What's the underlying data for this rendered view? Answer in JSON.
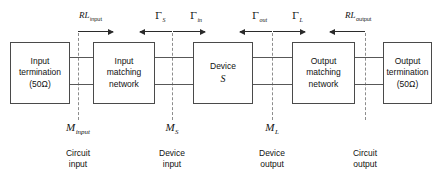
{
  "diagram": {
    "width": 438,
    "height": 185,
    "line_color": "#585858",
    "box_border_color": "#4a4a4a",
    "dash_color": "#8d8d8d",
    "background": "#ffffff"
  },
  "blocks": [
    {
      "id": "input-termination",
      "line1": "Input",
      "line2": "termination",
      "line3": "(50Ω)"
    },
    {
      "id": "input-matching-network",
      "line1": "Input",
      "line2": "matching",
      "line3": "network"
    },
    {
      "id": "device",
      "line1": "Device",
      "line2": "S"
    },
    {
      "id": "output-matching-network",
      "line1": "Output",
      "line2": "matching",
      "line3": "network"
    },
    {
      "id": "output-termination",
      "line1": "Output",
      "line2": "termination",
      "line3": "(50Ω)"
    }
  ],
  "top_labels": [
    {
      "id": "rl-input",
      "symbol": "RL",
      "subscript": "input",
      "direction": "right"
    },
    {
      "id": "gamma-s",
      "symbol": "Γ",
      "subscript": "S",
      "direction": "left"
    },
    {
      "id": "gamma-in",
      "symbol": "Γ",
      "subscript": "in",
      "direction": "right"
    },
    {
      "id": "gamma-out",
      "symbol": "Γ",
      "subscript": "out",
      "direction": "left"
    },
    {
      "id": "gamma-l",
      "symbol": "Γ",
      "subscript": "L",
      "direction": "right"
    },
    {
      "id": "rl-output",
      "symbol": "RL",
      "subscript": "output",
      "direction": "left"
    }
  ],
  "reference_planes": [
    {
      "id": "m-input",
      "symbol": "M",
      "subscript": "input",
      "caption_line1": "Circuit",
      "caption_line2": "input"
    },
    {
      "id": "m-s",
      "symbol": "M",
      "subscript": "S",
      "caption_line1": "Device",
      "caption_line2": "input"
    },
    {
      "id": "m-l",
      "symbol": "M",
      "subscript": "L",
      "caption_line1": "Device",
      "caption_line2": "output"
    },
    {
      "id": "m-circuit-output",
      "symbol": "",
      "subscript": "",
      "caption_line1": "Circuit",
      "caption_line2": "output"
    }
  ]
}
